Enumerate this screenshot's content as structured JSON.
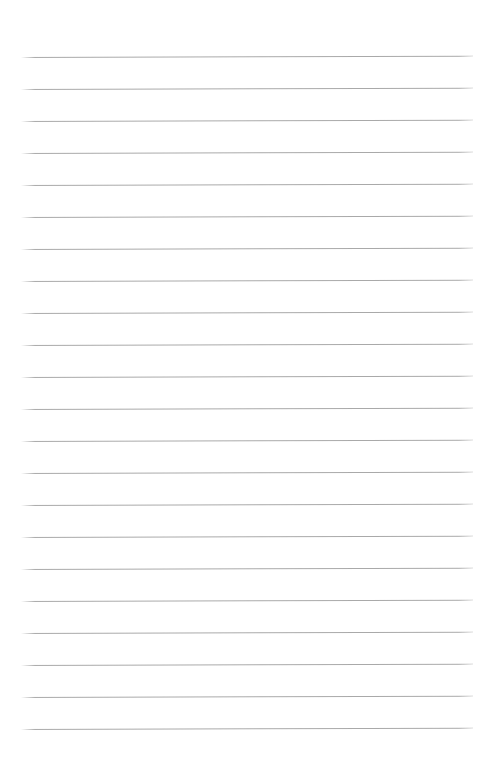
{
  "page": {
    "width": 495,
    "height": 758,
    "background_color": "#ffffff",
    "type": "blank-ruled-page"
  },
  "ruling": {
    "line_color": "#9b9b9b",
    "line_count": 22,
    "line_thickness_px": 1,
    "first_line_y": 57,
    "line_spacing_px": 32,
    "line_left_x": 21,
    "line_right_x": 473,
    "line_length_px": 452,
    "tilt_degrees": -0.17,
    "top_margin_px": 57,
    "left_margin_px": 21,
    "right_margin_px": 22,
    "lines_y": [
      57,
      89,
      121,
      153,
      185,
      217,
      249,
      281,
      313,
      345,
      377,
      409,
      441,
      473,
      505,
      537,
      569,
      601,
      633,
      665,
      697,
      729
    ]
  },
  "content": {
    "body_text": "",
    "has_written_text": false
  },
  "footer": {
    "watermark_text": "",
    "watermark_color": "#fcfcfc",
    "watermark_y": 751,
    "visible": true
  }
}
